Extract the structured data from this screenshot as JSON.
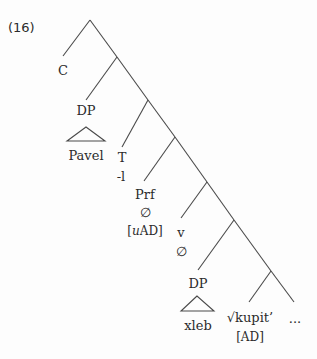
{
  "example_number": "(16)",
  "colors": {
    "line": "#4a4a4a",
    "text": "#2b2b2b",
    "background": "#fdfdfd"
  },
  "nodes": {
    "c": {
      "label": "C"
    },
    "dp_subject": {
      "label": "DP",
      "terminal": "Pavel"
    },
    "t": {
      "label": "T",
      "exponent": "-l"
    },
    "prf": {
      "label": "Prf",
      "exponent": "∅",
      "feature_prefix": "[",
      "feature_uninterpretable": "u",
      "feature": "AD",
      "feature_suffix": "]"
    },
    "v": {
      "label": "v",
      "exponent": "∅"
    },
    "dp_object": {
      "label": "DP",
      "terminal": "xleb"
    },
    "root": {
      "label": "√kupit’",
      "feature": "[AD]"
    },
    "continuation": {
      "label": "..."
    }
  }
}
